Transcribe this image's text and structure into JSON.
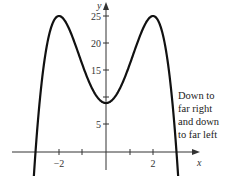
{
  "chart_data": {
    "type": "line",
    "title": "",
    "xlabel": "x",
    "ylabel": "y",
    "xlim": [
      -4.3,
      4.3
    ],
    "ylim": [
      -4.5,
      27
    ],
    "x_ticks": [
      -3,
      -2,
      -1,
      0,
      1,
      2,
      3
    ],
    "x_tick_labels": {
      "-2": "-2",
      "2": "2"
    },
    "y_ticks": [
      5,
      10,
      15,
      20,
      25
    ],
    "y_tick_labels": [
      "5",
      "10",
      "15",
      "20",
      "25"
    ],
    "grid": false,
    "series": [
      {
        "name": "f(x) = -x^4 + 8x^2 + 9",
        "x": [
          -3.15,
          -3,
          -2.5,
          -2,
          -1.5,
          -1,
          -0.5,
          0,
          0.5,
          1,
          1.5,
          2,
          2.5,
          3,
          3.15
        ],
        "values": [
          -4.0,
          0,
          19.94,
          25,
          21.94,
          16,
          10.94,
          9,
          10.94,
          16,
          21.94,
          25,
          19.94,
          0,
          -4.0
        ]
      }
    ],
    "annotations": [
      "Down to",
      "far right",
      "and down",
      "to far left"
    ]
  },
  "labels": {
    "x_axis": "x",
    "y_axis": "y",
    "x_minus2": "−2",
    "x_2": "2",
    "y5": "5",
    "y10": "10",
    "y15": "15",
    "y20": "20",
    "y25": "25"
  },
  "annotation": {
    "line1": "Down to",
    "line2": "far right",
    "line3": "and down",
    "line4": "to far left"
  }
}
